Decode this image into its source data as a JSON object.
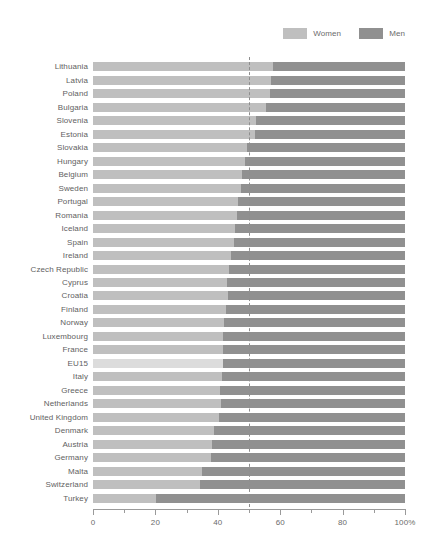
{
  "legend": {
    "items": [
      {
        "label": "Women",
        "color": "#bfbfbf",
        "icon": "legend-swatch-icon"
      },
      {
        "label": "Men",
        "color": "#909090",
        "icon": "legend-swatch-icon"
      }
    ]
  },
  "axis": {
    "ticks_major": [
      0,
      20,
      40,
      60,
      80,
      100
    ],
    "tick_labels": [
      "0",
      "20",
      "40",
      "60",
      "80",
      "100%"
    ],
    "ticks_minor": [
      10,
      30,
      50,
      70,
      90
    ],
    "reference_line_value": 50
  },
  "colors": {
    "women": "#bfbfbf",
    "men": "#909090",
    "women_highlight": "#dcdcdc",
    "reference_line": "#8e8e8e",
    "axis": "#9a9a9a",
    "text": "#616161",
    "background": "#ffffff"
  },
  "chart_data": {
    "type": "bar",
    "orientation": "horizontal",
    "stacked": true,
    "normalized_percent": true,
    "title": "",
    "subtitle": "",
    "xlabel": "",
    "ylabel": "",
    "xlim": [
      0,
      100
    ],
    "xticks": [
      0,
      20,
      40,
      60,
      80,
      100
    ],
    "xticklabels": [
      "0",
      "20",
      "40",
      "60",
      "80",
      "100%"
    ],
    "grid": false,
    "legend_position": "top-right",
    "annotations": [
      {
        "type": "vline",
        "value": 50,
        "style": "dashed",
        "label": ""
      }
    ],
    "categories": [
      "Lithuania",
      "Latvia",
      "Poland",
      "Bulgaria",
      "Slovenia",
      "Estonia",
      "Slovakia",
      "Hungary",
      "Belgium",
      "Sweden",
      "Portugal",
      "Romania",
      "Iceland",
      "Spain",
      "Ireland",
      "Czech Republic",
      "Cyprus",
      "Croatia",
      "Finland",
      "Norway",
      "Luxembourg",
      "France",
      "EU15",
      "Italy",
      "Greece",
      "Netherlands",
      "United Kingdom",
      "Denmark",
      "Austria",
      "Germany",
      "Malta",
      "Switzerland",
      "Turkey"
    ],
    "series": [
      {
        "name": "Women",
        "values": [
          57.8,
          57.0,
          56.7,
          55.3,
          52.1,
          51.9,
          49.2,
          48.7,
          47.9,
          47.4,
          46.6,
          46.0,
          45.5,
          45.1,
          44.3,
          43.5,
          43.0,
          43.2,
          42.5,
          42.0,
          41.8,
          41.6,
          41.6,
          41.4,
          40.6,
          40.9,
          40.5,
          38.7,
          38.3,
          37.7,
          34.8,
          34.2,
          20.2
        ]
      },
      {
        "name": "Men",
        "values": [
          42.2,
          43.0,
          43.3,
          44.7,
          47.9,
          48.1,
          50.8,
          51.3,
          52.1,
          52.6,
          53.4,
          54.0,
          54.5,
          54.9,
          55.7,
          56.5,
          57.0,
          56.8,
          57.5,
          58.0,
          58.2,
          58.4,
          58.4,
          58.6,
          59.4,
          59.1,
          59.5,
          61.3,
          61.7,
          62.3,
          65.2,
          65.8,
          79.8
        ]
      }
    ],
    "highlighted_category": "EU15"
  }
}
